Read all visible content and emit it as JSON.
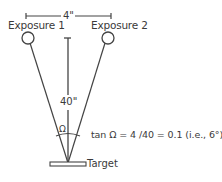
{
  "diagram": {
    "labels": {
      "exposure1": "Exposure 1",
      "exposure2": "Exposure 2",
      "horizontal_distance": "4\"",
      "vertical_distance": "40\"",
      "angle_symbol": "Ω",
      "equation": "tan Ω = 4 /40 = 0.1 (i.e., 6°)",
      "target": "Target"
    },
    "colors": {
      "line": "#444444",
      "text": "#3a3a3a",
      "background": "#ffffff"
    }
  }
}
